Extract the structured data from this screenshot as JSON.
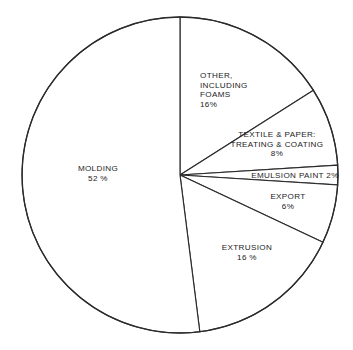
{
  "chart_data": {
    "type": "pie",
    "title": "",
    "subtitle": "",
    "xlabel": "",
    "ylabel": "",
    "grid": false,
    "legend": "none",
    "labels_inline": true,
    "start_angle_deg": -90,
    "direction": "clockwise",
    "total_percent": 100,
    "categories": [
      "MOLDING",
      "OTHER, INCLUDING FOAMS",
      "TEXTILE & PAPER: TREATING & COATING",
      "EMULSION PAINT",
      "EXPORT",
      "EXTRUSION"
    ],
    "values": [
      52,
      16,
      8,
      2,
      6,
      16
    ],
    "slices": [
      {
        "name": "molding",
        "percent": 52,
        "label_lines": [
          "MOLDING",
          "52 %"
        ],
        "align": "center",
        "fill": "#ffffff",
        "stroke": "#2b2b2b"
      },
      {
        "name": "other-including-foams",
        "percent": 16,
        "label_lines": [
          "OTHER,",
          "INCLUDING",
          "FOAMS",
          "16%"
        ],
        "align": "left",
        "fill": "#ffffff",
        "stroke": "#2b2b2b"
      },
      {
        "name": "textile-and-paper-treating-and-coating",
        "percent": 8,
        "label_lines": [
          "TEXTILE & PAPER:",
          "TREATING & COATING",
          "8%"
        ],
        "align": "center",
        "fill": "#ffffff",
        "stroke": "#2b2b2b"
      },
      {
        "name": "emulsion-paint",
        "percent": 2,
        "label_lines": [
          "EMULSION  PAINT 2%"
        ],
        "align": "center",
        "fill": "#ffffff",
        "stroke": "#2b2b2b"
      },
      {
        "name": "export",
        "percent": 6,
        "label_lines": [
          "EXPORT",
          "6%"
        ],
        "align": "center",
        "fill": "#ffffff",
        "stroke": "#2b2b2b"
      },
      {
        "name": "extrusion",
        "percent": 16,
        "label_lines": [
          "EXTRUSION",
          "16 %"
        ],
        "align": "center",
        "fill": "#ffffff",
        "stroke": "#2b2b2b"
      }
    ]
  },
  "labels": {
    "molding": {
      "l1": "MOLDING",
      "l2": "52 %"
    },
    "other": {
      "l1": "OTHER,",
      "l2": "INCLUDING",
      "l3": "FOAMS",
      "l4": "16%"
    },
    "textile": {
      "l1": "TEXTILE & PAPER:",
      "l2": "TREATING & COATING",
      "l3": "8%"
    },
    "emulsion": {
      "l1": "EMULSION  PAINT 2%"
    },
    "export": {
      "l1": "EXPORT",
      "l2": "6%"
    },
    "extrusion": {
      "l1": "EXTRUSION",
      "l2": "16 %"
    }
  },
  "style": {
    "background": "#ffffff",
    "line_color": "#2b2b2b",
    "slice_fill": "#ffffff",
    "text_color": "#1c1c1c"
  },
  "geometry": {
    "center_x": 180,
    "center_y": 175,
    "radius": 158
  }
}
